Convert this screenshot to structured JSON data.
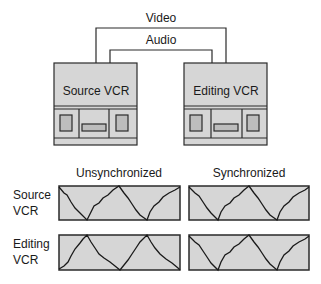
{
  "connections": {
    "video_label": "Video",
    "audio_label": "Audio"
  },
  "devices": [
    {
      "label": "Source VCR"
    },
    {
      "label": "Editing VCR"
    }
  ],
  "grid": {
    "columns": [
      "Unsynchronized",
      "Synchronized"
    ],
    "rows": [
      {
        "label_line1": "Source",
        "label_line2": "VCR"
      },
      {
        "label_line1": "Editing",
        "label_line2": "VCR"
      }
    ]
  },
  "colors": {
    "box_fill": "#d6d6d6",
    "stroke": "#2a2a2a",
    "background": "#ffffff"
  }
}
